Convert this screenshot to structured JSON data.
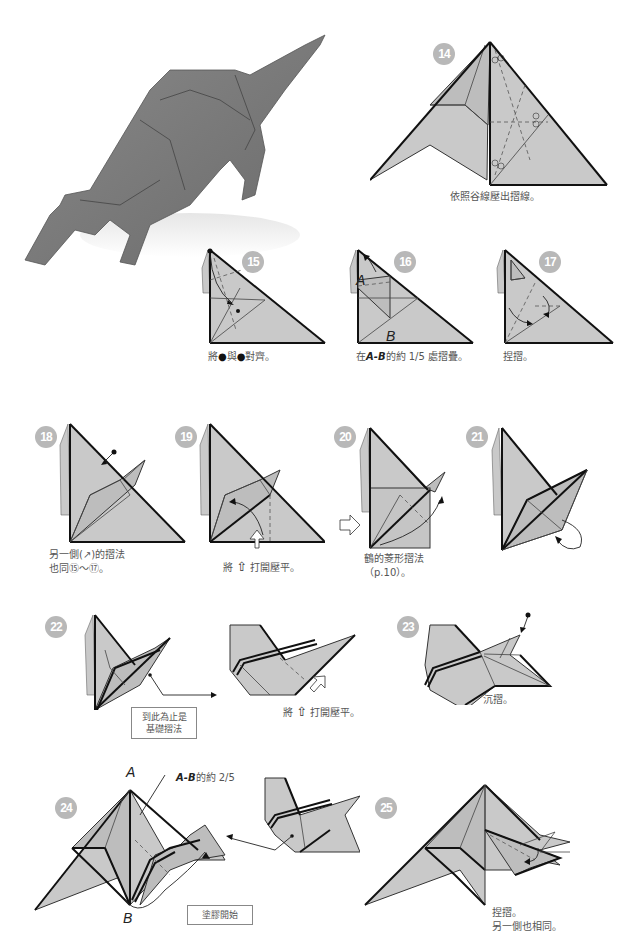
{
  "page": {
    "photo": {
      "subject": "origami-rhino-photo",
      "alt": "Folded origami rhinoceros model"
    },
    "steps": [
      {
        "number": "14",
        "caption": "依照谷線壓出摺線。"
      },
      {
        "number": "15",
        "caption_parts": [
          "將",
          "●",
          "與",
          "●",
          "對齊。"
        ]
      },
      {
        "number": "16",
        "caption_prefix": "在",
        "caption_em": "A-B",
        "caption_suffix": "的約 1/5 處摺疊。",
        "labels": [
          "A",
          "B"
        ]
      },
      {
        "number": "17",
        "caption": "捏摺。"
      },
      {
        "number": "18",
        "caption_line1": "另一側(↗)的摺法",
        "caption_line2": "也同⑮～⑰。"
      },
      {
        "number": "19",
        "caption_prefix": "將",
        "caption_icon": "hollow-up-arrow",
        "caption_suffix": "打開壓平。"
      },
      {
        "number": "20",
        "caption_line1": "鶴的菱形摺法",
        "caption_line2": "（p.10）。"
      },
      {
        "number": "21",
        "caption": ""
      },
      {
        "number": "22",
        "note_line1": "到此為止是",
        "note_line2": "基礎摺法",
        "detail_caption_prefix": "將",
        "detail_caption_suffix": "打開壓平。"
      },
      {
        "number": "23",
        "caption": "沉摺。"
      },
      {
        "number": "24",
        "labels": [
          "A",
          "B"
        ],
        "annotation_em": "A-B",
        "annotation_suffix": "的約 2/5",
        "note": "塗膠開始"
      },
      {
        "number": "25",
        "caption_line1": "捏摺。",
        "caption_line2": "另一側也相同。"
      }
    ],
    "colors": {
      "paper": "#c9c9c9",
      "badge": "#b8b8b8",
      "line": "#111111",
      "text": "#555555"
    }
  }
}
